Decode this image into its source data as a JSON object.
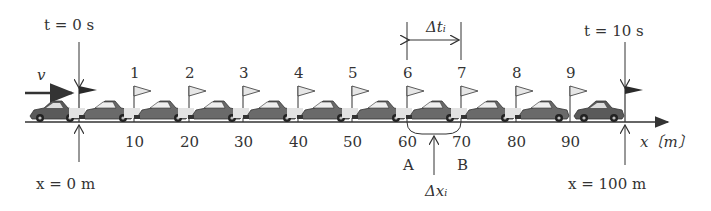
{
  "diagram": {
    "velocity_label": "v",
    "start": {
      "time_label": "t = 0 s",
      "pos_label": "x = 0 m"
    },
    "end": {
      "time_label": "t = 10 s",
      "pos_label": "x = 100 m"
    },
    "flag_numbers": [
      "1",
      "2",
      "3",
      "4",
      "5",
      "6",
      "7",
      "8",
      "9"
    ],
    "tick_values": [
      "10",
      "20",
      "30",
      "40",
      "50",
      "60",
      "70",
      "80",
      "90"
    ],
    "axis_label": "x〔m〕",
    "interval": {
      "dt_label": "Δtᵢ",
      "dx_label": "Δxᵢ",
      "point_a": "A",
      "point_b": "B"
    },
    "colors": {
      "ink": "#333333",
      "flag_light": "#e6e6e6",
      "flag_dark": "#2a2a2a",
      "car_body": "#555555"
    }
  }
}
